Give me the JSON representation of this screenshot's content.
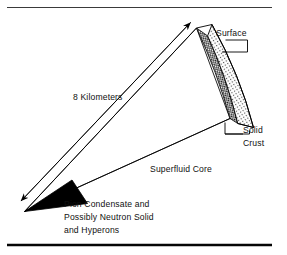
{
  "figure": {
    "background_color": "#ffffff",
    "ink_color": "#000000",
    "rules": {
      "top_rule_color": "#3a3a3a",
      "bottom_rule_color": "#050505"
    }
  },
  "labels": {
    "scale_arrow": "8 Kilometers",
    "surface": "Surface",
    "solid_crust_line1": "Solid",
    "solid_crust_line2": "Crust",
    "superfluid_core": "Superfluid Core",
    "core_center_line1": "Pion Condensate and",
    "core_center_line2": "Possibly Neutron Solid",
    "core_center_line3": "and Hyperons"
  },
  "regions": [
    {
      "name": "surface-outer-crust",
      "label": "Surface",
      "fill": "stipple-dots",
      "fill_color": "#ffffff",
      "dot_color": "#3f3f3f"
    },
    {
      "name": "solid-crust",
      "label": "Solid Crust",
      "fill": "checkerboard",
      "fill_color": "#ffffff",
      "check_color": "#111111"
    },
    {
      "name": "superfluid-core",
      "label": "Superfluid Core",
      "fill": "none",
      "fill_color": "#ffffff"
    },
    {
      "name": "inner-core",
      "label": "Pion Condensate and Possibly Neutron Solid and Hyperons",
      "fill": "solid",
      "fill_color": "#000000"
    }
  ],
  "annotations": {
    "scale_arrow_double_headed": "true",
    "scale_value": "8",
    "scale_unit": "Kilometers"
  }
}
